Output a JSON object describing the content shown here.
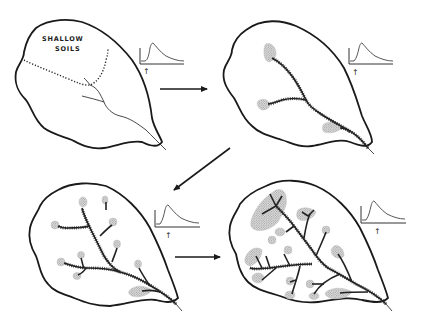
{
  "figure": {
    "type": "diagram",
    "panels": [
      {
        "id": 1,
        "position": "top-left",
        "label": "SHALLOW",
        "label_line2": "SOILS",
        "features": [
          "watershed-outline",
          "dotted-shallow-soil-boundary",
          "thin-stream-network"
        ],
        "hydrograph": {
          "rain_marker": "↑"
        }
      },
      {
        "id": 2,
        "position": "top-right",
        "features": [
          "watershed-outline",
          "expanded-channel-network",
          "stippled-source-areas"
        ],
        "source_area_count": 3,
        "hydrograph": {
          "rain_marker": "↑"
        }
      },
      {
        "id": 3,
        "position": "bottom-left",
        "features": [
          "watershed-outline",
          "further-expanded-channel-network",
          "stippled-source-areas"
        ],
        "source_area_count": 10,
        "hydrograph": {
          "rain_marker": "↑"
        }
      },
      {
        "id": 4,
        "position": "bottom-right",
        "features": [
          "watershed-outline",
          "fully-expanded-channel-network",
          "large-stippled-source-areas"
        ],
        "source_area_count": 14,
        "hydrograph": {
          "rain_marker": "↑"
        }
      }
    ],
    "arrows": [
      {
        "from": 1,
        "to": 2,
        "direction": "right"
      },
      {
        "from": 2,
        "to": 3,
        "direction": "down-left"
      },
      {
        "from": 3,
        "to": 4,
        "direction": "right"
      }
    ],
    "colors": {
      "ink": "#1a1a1a",
      "stipple": "#9a9a9a",
      "background": "#ffffff"
    }
  }
}
